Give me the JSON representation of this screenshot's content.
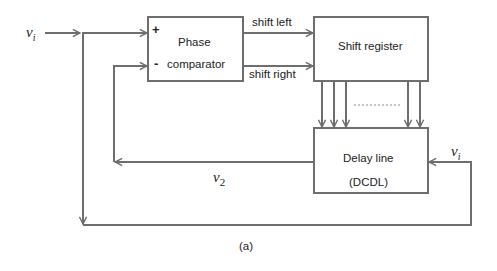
{
  "diagram": {
    "caption": "(a)",
    "blocks": {
      "phase_comparator": {
        "line1": "Phase",
        "line2": "comparator",
        "plus": "+",
        "minus": "-"
      },
      "shift_register": {
        "label": "Shift register"
      },
      "delay_line": {
        "line1": "Delay line",
        "line2": "(DCDL)"
      }
    },
    "signals": {
      "input_main": "v",
      "input_main_sub": "i",
      "input_delay": "v",
      "input_delay_sub": "i",
      "output": "v",
      "output_sub": "2",
      "shift_left": "shift left",
      "shift_right": "shift right"
    },
    "colors": {
      "line": "#6e6e6e",
      "text": "#222222"
    }
  }
}
